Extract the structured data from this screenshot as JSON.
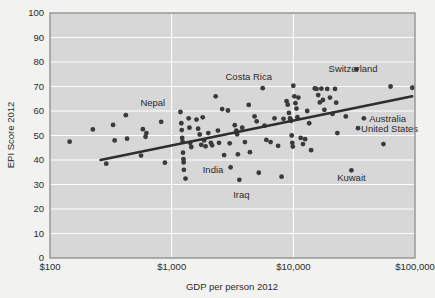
{
  "chart_data": {
    "type": "scatter",
    "title": "",
    "xlabel": "GDP per person 2012",
    "ylabel": "EPI Score 2012",
    "xscale": "log",
    "xlim": [
      100,
      100000
    ],
    "ylim": [
      0,
      100
    ],
    "grid": true,
    "legend": "none",
    "xticks": [
      {
        "value": 100,
        "label": "$100"
      },
      {
        "value": 1000,
        "label": "$1,000"
      },
      {
        "value": 10000,
        "label": "$10,000"
      },
      {
        "value": 100000,
        "label": "$100,000"
      }
    ],
    "yticks": [
      {
        "value": 0,
        "label": "0"
      },
      {
        "value": 10,
        "label": "10"
      },
      {
        "value": 20,
        "label": "20"
      },
      {
        "value": 30,
        "label": "30"
      },
      {
        "value": 40,
        "label": "40"
      },
      {
        "value": 50,
        "label": "50"
      },
      {
        "value": 60,
        "label": "60"
      },
      {
        "value": 70,
        "label": "70"
      },
      {
        "value": 80,
        "label": "80"
      },
      {
        "value": 90,
        "label": "90"
      },
      {
        "value": 100,
        "label": "100"
      }
    ],
    "trendline": {
      "x_start": 260,
      "y_start": 40.0,
      "x_end": 95000,
      "y_end": 66.0,
      "color": "#2e2e2e"
    },
    "marker": {
      "shape": "circle",
      "size": 2.4,
      "color": "#3a3a3a"
    },
    "annotations": [
      {
        "text": "Nepal",
        "x": 700,
        "y": 63.5,
        "anchor": "middle"
      },
      {
        "text": "Costa Rica",
        "x": 4300,
        "y": 74.0,
        "anchor": "middle"
      },
      {
        "text": "Switzerland",
        "x": 31000,
        "y": 77.5,
        "anchor": "middle"
      },
      {
        "text": "Australia",
        "x": 42000,
        "y": 57.0,
        "anchor": "start"
      },
      {
        "text": "United States",
        "x": 36000,
        "y": 53.0,
        "anchor": "start"
      },
      {
        "text": "India",
        "x": 1800,
        "y": 36.0,
        "anchor": "start"
      },
      {
        "text": "Iraq",
        "x": 3200,
        "y": 26.0,
        "anchor": "start"
      },
      {
        "text": "Kuwait",
        "x": 30000,
        "y": 33.0,
        "anchor": "middle"
      }
    ],
    "points": [
      {
        "x": 145,
        "y": 47.5
      },
      {
        "x": 225,
        "y": 52.5
      },
      {
        "x": 290,
        "y": 38.5
      },
      {
        "x": 330,
        "y": 54.3
      },
      {
        "x": 340,
        "y": 48.0
      },
      {
        "x": 420,
        "y": 58.3
      },
      {
        "x": 430,
        "y": 48.7
      },
      {
        "x": 560,
        "y": 41.8
      },
      {
        "x": 580,
        "y": 52.6
      },
      {
        "x": 610,
        "y": 49.5
      },
      {
        "x": 620,
        "y": 51.0
      },
      {
        "x": 820,
        "y": 55.6
      },
      {
        "x": 880,
        "y": 38.9
      },
      {
        "x": 1180,
        "y": 59.6
      },
      {
        "x": 1200,
        "y": 55.0
      },
      {
        "x": 1210,
        "y": 52.2
      },
      {
        "x": 1220,
        "y": 49.0
      },
      {
        "x": 1230,
        "y": 47.5
      },
      {
        "x": 1240,
        "y": 43.0
      },
      {
        "x": 1250,
        "y": 40.3
      },
      {
        "x": 1255,
        "y": 39.0
      },
      {
        "x": 1260,
        "y": 36.0
      },
      {
        "x": 1300,
        "y": 32.4
      },
      {
        "x": 1380,
        "y": 57.0
      },
      {
        "x": 1400,
        "y": 53.2
      },
      {
        "x": 1420,
        "y": 47.0
      },
      {
        "x": 1450,
        "y": 45.3
      },
      {
        "x": 1600,
        "y": 56.5
      },
      {
        "x": 1650,
        "y": 52.8
      },
      {
        "x": 1700,
        "y": 50.4
      },
      {
        "x": 1750,
        "y": 46.2
      },
      {
        "x": 1800,
        "y": 57.4
      },
      {
        "x": 1850,
        "y": 48.0
      },
      {
        "x": 1900,
        "y": 45.6
      },
      {
        "x": 2000,
        "y": 51.0
      },
      {
        "x": 2100,
        "y": 47.0
      },
      {
        "x": 2150,
        "y": 46.0
      },
      {
        "x": 2300,
        "y": 66.0
      },
      {
        "x": 2400,
        "y": 52.0
      },
      {
        "x": 2450,
        "y": 47.0
      },
      {
        "x": 2600,
        "y": 60.8
      },
      {
        "x": 2700,
        "y": 42.0
      },
      {
        "x": 2900,
        "y": 60.2
      },
      {
        "x": 3000,
        "y": 46.8
      },
      {
        "x": 3050,
        "y": 37.0
      },
      {
        "x": 3300,
        "y": 54.2
      },
      {
        "x": 3400,
        "y": 52.0
      },
      {
        "x": 3450,
        "y": 50.5
      },
      {
        "x": 3500,
        "y": 42.3
      },
      {
        "x": 3600,
        "y": 31.9
      },
      {
        "x": 3800,
        "y": 53.2
      },
      {
        "x": 4000,
        "y": 47.3
      },
      {
        "x": 4300,
        "y": 62.5
      },
      {
        "x": 4400,
        "y": 43.2
      },
      {
        "x": 4800,
        "y": 57.8
      },
      {
        "x": 5000,
        "y": 55.8
      },
      {
        "x": 5200,
        "y": 34.8
      },
      {
        "x": 5600,
        "y": 69.3
      },
      {
        "x": 5800,
        "y": 54.0
      },
      {
        "x": 6000,
        "y": 48.2
      },
      {
        "x": 6500,
        "y": 47.3
      },
      {
        "x": 7000,
        "y": 57.0
      },
      {
        "x": 7500,
        "y": 45.8
      },
      {
        "x": 8000,
        "y": 33.2
      },
      {
        "x": 8300,
        "y": 56.8
      },
      {
        "x": 8800,
        "y": 64.0
      },
      {
        "x": 9000,
        "y": 62.6
      },
      {
        "x": 9200,
        "y": 59.2
      },
      {
        "x": 9400,
        "y": 57.0
      },
      {
        "x": 9500,
        "y": 56.5
      },
      {
        "x": 9600,
        "y": 56.0
      },
      {
        "x": 9700,
        "y": 50.0
      },
      {
        "x": 9800,
        "y": 47.0
      },
      {
        "x": 9900,
        "y": 45.5
      },
      {
        "x": 10000,
        "y": 70.3
      },
      {
        "x": 10200,
        "y": 66.0
      },
      {
        "x": 10400,
        "y": 63.2
      },
      {
        "x": 10600,
        "y": 61.0
      },
      {
        "x": 10800,
        "y": 57.5
      },
      {
        "x": 11000,
        "y": 65.5
      },
      {
        "x": 11500,
        "y": 49.0
      },
      {
        "x": 12000,
        "y": 46.5
      },
      {
        "x": 12500,
        "y": 48.5
      },
      {
        "x": 13000,
        "y": 60.0
      },
      {
        "x": 13500,
        "y": 55.0
      },
      {
        "x": 14000,
        "y": 44.0
      },
      {
        "x": 15000,
        "y": 69.2
      },
      {
        "x": 15500,
        "y": 69.0
      },
      {
        "x": 16000,
        "y": 66.5
      },
      {
        "x": 16500,
        "y": 63.5
      },
      {
        "x": 17000,
        "y": 69.1
      },
      {
        "x": 17500,
        "y": 64.5
      },
      {
        "x": 18000,
        "y": 60.5
      },
      {
        "x": 19000,
        "y": 69.0
      },
      {
        "x": 20000,
        "y": 65.5
      },
      {
        "x": 21000,
        "y": 58.8
      },
      {
        "x": 22000,
        "y": 69.0
      },
      {
        "x": 22500,
        "y": 63.4
      },
      {
        "x": 23000,
        "y": 51.0
      },
      {
        "x": 27000,
        "y": 57.8
      },
      {
        "x": 30000,
        "y": 35.8
      },
      {
        "x": 33000,
        "y": 77.0
      },
      {
        "x": 38000,
        "y": 57.0
      },
      {
        "x": 34000,
        "y": 53.0
      },
      {
        "x": 55000,
        "y": 46.5
      },
      {
        "x": 63000,
        "y": 70.0
      },
      {
        "x": 95000,
        "y": 69.5
      }
    ]
  }
}
